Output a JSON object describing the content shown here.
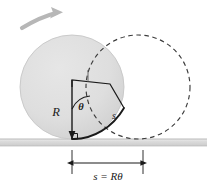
{
  "figure": {
    "background_color": "#ffffff",
    "ground": {
      "name": "ground-line",
      "color": "#d9d9d9",
      "edge_color": "#9a9a9a",
      "y": 139,
      "thickness": 7
    },
    "circles": {
      "start": {
        "name": "rolling-circle-start",
        "style": "solid-filled",
        "fill_color": "#dedede",
        "stroke_color": "#c2c2c2",
        "cx": 72,
        "cy": 87,
        "r": 52
      },
      "end": {
        "name": "rolling-circle-end",
        "style": "dashed-outline",
        "fill_color": "none",
        "stroke_color": "#3a3a3a",
        "cx": 138,
        "cy": 87,
        "r": 52
      }
    },
    "motion_arrow": {
      "name": "rotation-direction-arrow",
      "color": "#b5b5b5",
      "direction": "up-right"
    },
    "sector": {
      "name": "angle-sector-wedge",
      "stroke_color": "#1a1a1a",
      "fill_color": "none",
      "vertex_x": 72,
      "vertex_y": 87,
      "radius": 52
    },
    "labels": {
      "radius": "R",
      "angle": "θ",
      "arc": "s",
      "arc_length_equation": "s = Rθ"
    },
    "dimension": {
      "name": "arc-length-dimension",
      "color": "#1a1a1a",
      "x_start": 72,
      "x_end": 143,
      "y": 163,
      "tick_top": 150,
      "tick_bottom": 172
    }
  }
}
